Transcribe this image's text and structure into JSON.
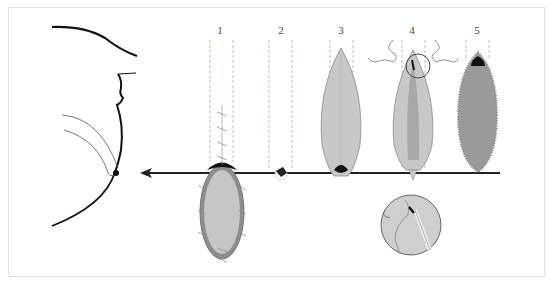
{
  "figure": {
    "steps": [
      {
        "label": "1",
        "x": 220
      },
      {
        "label": "2",
        "x": 281
      },
      {
        "label": "3",
        "x": 341
      },
      {
        "label": "4",
        "x": 412
      },
      {
        "label": "5",
        "x": 478
      }
    ],
    "colors": {
      "fill_light": "#c8c8c8",
      "fill_mid": "#a9a9a9",
      "fill_dark": "#8e8e8e",
      "outline": "#6f6f6f",
      "dashes": "#d9a0a0",
      "arrow": "#222222"
    }
  }
}
